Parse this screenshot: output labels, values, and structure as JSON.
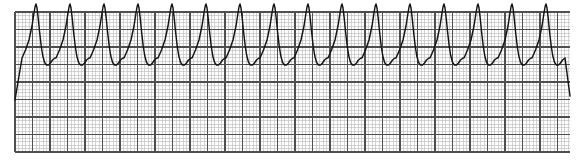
{
  "document": {
    "title": "ECG Rhythm Strip",
    "kind": "ecg-rhythm-strip",
    "canvas": {
      "width": 578,
      "height": 165,
      "background": "#ffffff"
    }
  },
  "paper": {
    "name": "ecg-graph-paper",
    "x": 15,
    "y": 12,
    "width": 555,
    "height": 140,
    "background": "#fdfdfd",
    "minor_box_px": 3.5,
    "major_box_px": 17.5,
    "minor_color": "#b9b9b9",
    "major_color": "#4f4f4f",
    "minor_width": 0.6,
    "major_width": 1.15
  },
  "chart_data": {
    "type": "line",
    "title": "",
    "subtitle": "",
    "xlabel": "",
    "ylabel": "",
    "legend": [],
    "grid": true,
    "rhythm": "monomorphic wide-complex tachycardia",
    "trace_color": "#141414",
    "trace_width": 1.45,
    "xlim": [
      15,
      570
    ],
    "ylim": [
      152,
      12
    ],
    "baseline_y": 88,
    "peak_y": 46,
    "trough_y": 107,
    "lead_in_y": 100,
    "beat_count": 16,
    "beat_period_px": 34.0,
    "first_peak_x": 36.0,
    "beat_shape": {
      "description": "slow diastolic ramp, sharp narrow R spike, steep descent, rounded trough, slow rise",
      "offsets": [
        {
          "dx": -14.0,
          "dy": 12.0
        },
        {
          "dx": -10.5,
          "dy": 4.0
        },
        {
          "dx": -7.0,
          "dy": -6.0
        },
        {
          "dx": -4.0,
          "dy": -20.0
        },
        {
          "dx": -2.0,
          "dy": -33.0
        },
        {
          "dx": -0.8,
          "dy": -40.0
        },
        {
          "dx": 0.0,
          "dy": -42.0
        },
        {
          "dx": 1.0,
          "dy": -38.0
        },
        {
          "dx": 2.2,
          "dy": -28.0
        },
        {
          "dx": 3.6,
          "dy": -14.0
        },
        {
          "dx": 5.2,
          "dy": 0.0
        },
        {
          "dx": 6.8,
          "dy": 10.0
        },
        {
          "dx": 8.6,
          "dy": 16.5
        },
        {
          "dx": 10.5,
          "dy": 19.0
        },
        {
          "dx": 12.5,
          "dy": 19.0
        },
        {
          "dx": 14.5,
          "dy": 17.0
        },
        {
          "dx": 16.5,
          "dy": 14.0
        },
        {
          "dx": 19.0,
          "dy": 12.0
        }
      ]
    }
  }
}
